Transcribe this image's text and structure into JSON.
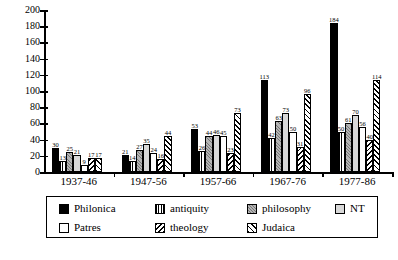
{
  "chart_data": {
    "type": "bar",
    "title": "",
    "subtitle": "",
    "xlabel": "",
    "ylabel": "",
    "grid": false,
    "legend_position": "bottom",
    "ylim": [
      0,
      200
    ],
    "ytick_step": 20,
    "yticks": [
      0,
      20,
      40,
      60,
      80,
      100,
      120,
      140,
      160,
      180,
      200
    ],
    "categories": [
      "1937-46",
      "1947-56",
      "1957-66",
      "1967-76",
      "1977-86"
    ],
    "series": [
      {
        "name": "Philonica",
        "fill": "solid-black",
        "values": [
          30,
          21,
          53,
          113,
          184
        ]
      },
      {
        "name": "antiquity",
        "fill": "vertical-lines",
        "values": [
          13,
          14,
          26,
          42,
          50
        ]
      },
      {
        "name": "philosophy",
        "fill": "gray-stipple",
        "values": [
          25,
          27,
          44,
          63,
          61
        ]
      },
      {
        "name": "NT",
        "fill": "light-gray",
        "values": [
          21,
          35,
          46,
          73,
          70
        ]
      },
      {
        "name": "Patres",
        "fill": "white",
        "values": [
          9,
          24,
          45,
          50,
          56
        ]
      },
      {
        "name": "theology",
        "fill": "back-hatch",
        "values": [
          17,
          16,
          23,
          31,
          40
        ]
      },
      {
        "name": "Judaica",
        "fill": "diagonal-hatch",
        "values": [
          17,
          44,
          73,
          96,
          114
        ]
      }
    ]
  },
  "legend": {
    "items": [
      {
        "label": "Philonica"
      },
      {
        "label": "antiquity"
      },
      {
        "label": "philosophy"
      },
      {
        "label": "NT"
      },
      {
        "label": "Patres"
      },
      {
        "label": "theology"
      },
      {
        "label": "Judaica"
      }
    ]
  }
}
